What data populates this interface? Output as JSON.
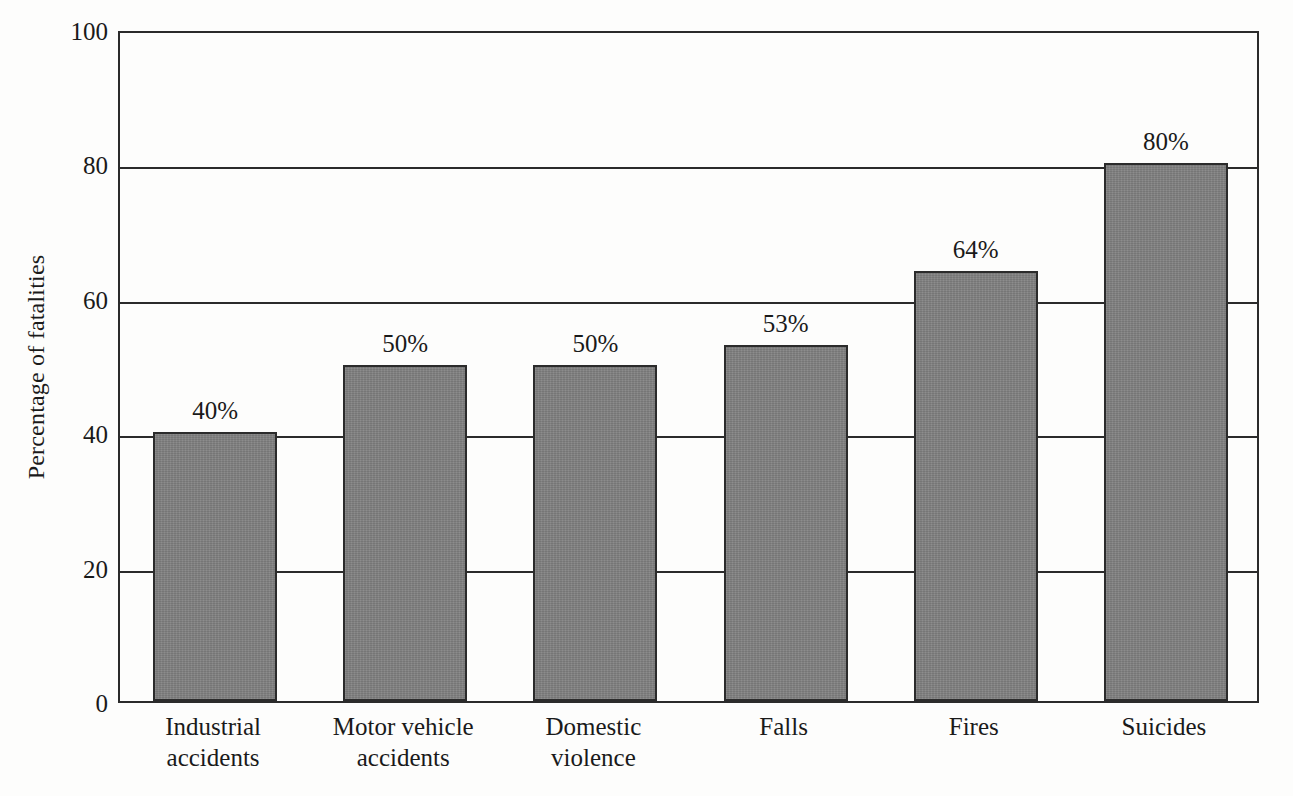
{
  "chart_data": {
    "type": "bar",
    "title": "",
    "subtitle": "",
    "xlabel": "",
    "ylabel": "Percentage of fatalities",
    "categories": [
      "Industrial accidents",
      "Motor vehicle accidents",
      "Domestic violence",
      "Falls",
      "Fires",
      "Suicides"
    ],
    "category_lines": [
      [
        "Industrial",
        "accidents"
      ],
      [
        "Motor vehicle",
        "accidents"
      ],
      [
        "Domestic",
        "violence"
      ],
      [
        "Falls"
      ],
      [
        "Fires"
      ],
      [
        "Suicides"
      ]
    ],
    "values": [
      40,
      50,
      50,
      53,
      64,
      80
    ],
    "data_labels": [
      "40%",
      "50%",
      "50%",
      "53%",
      "64%",
      "80%"
    ],
    "ylim": [
      0,
      100
    ],
    "yticks": [
      0,
      20,
      40,
      60,
      80,
      100
    ],
    "ytick_labels": [
      "0",
      "20",
      "40",
      "60",
      "80",
      "100"
    ],
    "grid": "horizontal",
    "gridlines_at": [
      20,
      40,
      60,
      80
    ],
    "legend": "none",
    "bar_color": "#808080",
    "bar_edge_color": "#2b2b2b",
    "axis_color": "#2b2b2b",
    "background_color": "#fdfdfc"
  }
}
